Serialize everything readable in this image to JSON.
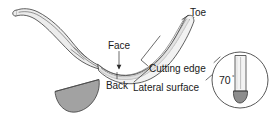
{
  "figure": {
    "labels": {
      "toe": "Toe",
      "face": "Face",
      "back": "Back",
      "cutting_edge": "Cutting edge",
      "lateral_surface": "Lateral surface",
      "angle": "70",
      "degree_symbol": "°"
    },
    "colors": {
      "outline": "#3a3a3a",
      "blade_fill": "#f2f2f2",
      "shank_fill": "#ececec",
      "cross_section_fill": "#a2a2a2",
      "tip_fill": "#8d8d8d",
      "label_text": "#1a1a1a",
      "leader_line": "#2b2b2b",
      "background": "#ffffff"
    },
    "parts": {
      "shank": "instrument-shank",
      "blade": "instrument-blade",
      "cross_section": "blade-cross-section-half-disc",
      "inset": "blade-angle-inset-circle"
    }
  }
}
